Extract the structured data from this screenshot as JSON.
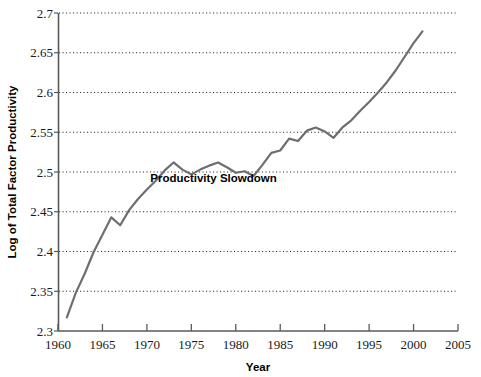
{
  "chart_data": {
    "type": "line",
    "title": "",
    "xlabel": "Year",
    "ylabel": "Log of Total Factor Productivity",
    "xlim": [
      1960,
      2005
    ],
    "ylim": [
      2.3,
      2.7
    ],
    "xticks": [
      1960,
      1965,
      1970,
      1975,
      1980,
      1985,
      1990,
      1995,
      2000,
      2005
    ],
    "yticks": [
      2.3,
      2.35,
      2.4,
      2.45,
      2.5,
      2.55,
      2.6,
      2.65,
      2.7
    ],
    "xtick_labels": [
      "1960",
      "1965",
      "1970",
      "1975",
      "1980",
      "1985",
      "1990",
      "1995",
      "2000",
      "2005"
    ],
    "ytick_labels": [
      "2.3",
      "2.35",
      "2.4",
      "2.45",
      "2.5",
      "2.55",
      "2.6",
      "2.65",
      "2.7"
    ],
    "grid": "horizontal-dotted",
    "legend": "none",
    "line_color": "#6e6e6e",
    "line_width": 2.2,
    "series": [
      {
        "name": "Log of Total Factor Productivity",
        "x": [
          1961,
          1962,
          1963,
          1964,
          1965,
          1966,
          1967,
          1968,
          1969,
          1970,
          1971,
          1972,
          1973,
          1974,
          1975,
          1976,
          1977,
          1978,
          1979,
          1980,
          1981,
          1982,
          1983,
          1984,
          1985,
          1986,
          1987,
          1988,
          1989,
          1990,
          1991,
          1992,
          1993,
          1994,
          1995,
          1996,
          1997,
          1998,
          1999,
          2000,
          2001
        ],
        "y": [
          2.317,
          2.348,
          2.372,
          2.399,
          2.421,
          2.443,
          2.433,
          2.452,
          2.466,
          2.478,
          2.489,
          2.502,
          2.512,
          2.503,
          2.497,
          2.503,
          2.508,
          2.512,
          2.506,
          2.499,
          2.501,
          2.495,
          2.509,
          2.524,
          2.527,
          2.542,
          2.539,
          2.552,
          2.556,
          2.551,
          2.543,
          2.556,
          2.565,
          2.577,
          2.588,
          2.6,
          2.613,
          2.628,
          2.645,
          2.662,
          2.677
        ]
      }
    ],
    "annotations": [
      {
        "text": "Productivity Slowdown",
        "x": 1977.5,
        "y": 2.488
      }
    ]
  },
  "axes": {
    "x_title": "Year",
    "y_title": "Log of Total Factor Productivity"
  }
}
